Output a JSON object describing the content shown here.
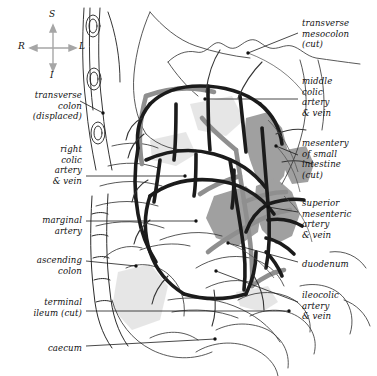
{
  "figure": {
    "style": "anatomical line drawing, grayscale"
  },
  "colors": {
    "artery": "#1c1c1c",
    "vein": "#8a8a8a",
    "mesentery_fill": "#9a9a9a",
    "outline": "#2b2b2b",
    "leader": "#1a1a1a",
    "compass": "#9b9b9b",
    "text": "#111111",
    "background": "#ffffff"
  },
  "compass": {
    "name": "orientation-indicator",
    "superior": "S",
    "inferior": "I",
    "right": "R",
    "left": "L"
  },
  "labels_left": [
    {
      "id": "transverse-colon",
      "text": "transverse\ncolon\n(displaced)",
      "x": 4,
      "y": 90,
      "w": 78,
      "leader": [
        [
          80,
          101
        ],
        [
          103,
          113
        ]
      ]
    },
    {
      "id": "right-colic",
      "text": "right\ncolic\nartery\n& vein",
      "x": 8,
      "y": 144,
      "w": 74,
      "leader": [
        [
          86,
          176
        ],
        [
          185,
          176
        ]
      ]
    },
    {
      "id": "marginal-artery",
      "text": "marginal\nartery",
      "x": 8,
      "y": 215,
      "w": 74,
      "leader": [
        [
          86,
          221
        ],
        [
          196,
          221
        ]
      ]
    },
    {
      "id": "ascending-colon",
      "text": "ascending\ncolon",
      "x": 4,
      "y": 255,
      "w": 78,
      "leader": [
        [
          86,
          261
        ],
        [
          136,
          266
        ]
      ]
    },
    {
      "id": "terminal-ileum",
      "text": "terminal\nileum (cut)",
      "x": 4,
      "y": 297,
      "w": 78,
      "leader": [
        [
          86,
          311
        ],
        [
          289,
          311
        ]
      ]
    },
    {
      "id": "caecum",
      "text": "caecum",
      "x": 8,
      "y": 343,
      "w": 74,
      "leader": [
        [
          86,
          346
        ],
        [
          215,
          339
        ]
      ]
    }
  ],
  "labels_right": [
    {
      "id": "transverse-mesocolon",
      "text": "transverse\nmesocolon\n(cut)",
      "x": 302,
      "y": 18,
      "w": 75,
      "leader": [
        [
          298,
          33
        ],
        [
          248,
          53
        ]
      ]
    },
    {
      "id": "middle-colic",
      "text": "middle\ncolic\nartery\n& vein",
      "x": 302,
      "y": 76,
      "w": 75,
      "leader": [
        [
          298,
          99
        ],
        [
          205,
          99
        ]
      ]
    },
    {
      "id": "mesentery-small-intestine",
      "text": "mesentery\nof small\nintestine\n(cut)",
      "x": 302,
      "y": 138,
      "w": 75,
      "leader": [
        [
          298,
          155
        ],
        [
          276,
          146
        ]
      ]
    },
    {
      "id": "superior-mesenteric",
      "text": "superior\nmesenteric\nartery\n& vein",
      "x": 302,
      "y": 198,
      "w": 75,
      "leader": [
        [
          298,
          212
        ],
        [
          268,
          207
        ]
      ]
    },
    {
      "id": "duodenum",
      "text": "duodenum",
      "x": 302,
      "y": 259,
      "w": 75,
      "leader": [
        [
          298,
          262
        ],
        [
          228,
          243
        ]
      ]
    },
    {
      "id": "ileocolic",
      "text": "ileocolic\nartery\n& vein",
      "x": 302,
      "y": 290,
      "w": 75,
      "leader": [
        [
          298,
          302
        ],
        [
          216,
          271
        ]
      ]
    }
  ]
}
